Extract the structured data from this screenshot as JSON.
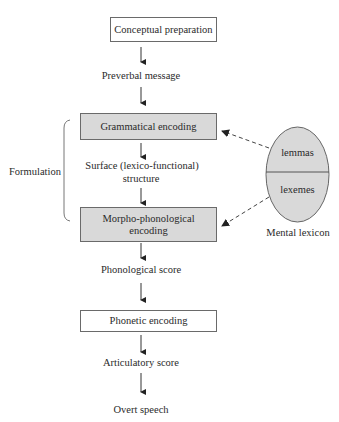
{
  "diagram": {
    "boxes": {
      "conceptual": "Conceptual preparation",
      "grammatical": "Grammatical encoding",
      "morpho_line1": "Morpho-phonological",
      "morpho_line2": "encoding",
      "phonetic": "Phonetic encoding"
    },
    "intermediates": {
      "preverbal": "Preverbal message",
      "surface_line1": "Surface (lexico-functional)",
      "surface_line2": "structure",
      "phonological": "Phonological score",
      "articulatory": "Articulatory score",
      "overt": "Overt speech"
    },
    "bracket_label": "Formulation",
    "lexicon": {
      "top": "lemmas",
      "bottom": "lexemes",
      "caption": "Mental lexicon"
    },
    "colors": {
      "shaded_fill": "#d9d9d9",
      "stroke": "#6a6a6a",
      "arrow": "#222222"
    }
  }
}
